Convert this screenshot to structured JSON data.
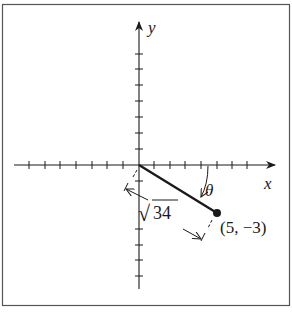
{
  "diagram": {
    "type": "coordinate-plane",
    "axes": {
      "x_label": "x",
      "y_label": "y",
      "tick_count_each_direction": 7,
      "tick_spacing_px": 15.5
    },
    "segment": {
      "from": "origin",
      "to_label": "(5, −3)",
      "point": [
        5,
        -3
      ]
    },
    "angle_label": "θ",
    "length_label": {
      "radical": "√",
      "radicand": "34"
    },
    "colors": {
      "ink": "#1a1a1a",
      "frame": "#555555",
      "background": "#ffffff"
    }
  }
}
